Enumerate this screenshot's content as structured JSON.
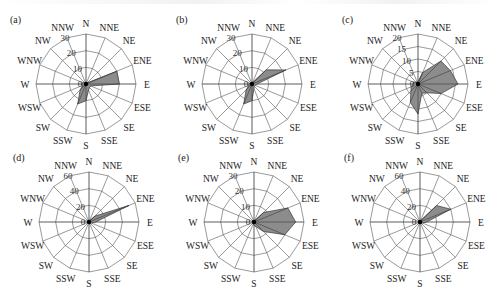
{
  "chart_data": [
    {
      "type": "rose",
      "panel": "(a)",
      "directions": [
        "N",
        "NNE",
        "NE",
        "ENE",
        "E",
        "ESE",
        "SE",
        "SSE",
        "S",
        "SSW",
        "SW",
        "WSW",
        "W",
        "WNW",
        "NW",
        "NNW"
      ],
      "values": [
        1,
        1,
        1,
        20,
        20,
        3,
        3,
        4,
        10,
        13,
        5,
        2,
        3,
        2,
        1,
        1
      ],
      "rmax": 30,
      "ticks": [
        0,
        10,
        20,
        30
      ],
      "tick_labels": [
        "0",
        "10",
        "20",
        "30"
      ]
    },
    {
      "type": "rose",
      "panel": "(b)",
      "directions": [
        "N",
        "NNE",
        "NE",
        "ENE",
        "E",
        "ESE",
        "SE",
        "SSE",
        "S",
        "SSW",
        "SW",
        "WSW",
        "W",
        "WNW",
        "NW",
        "NNW"
      ],
      "values": [
        1,
        1,
        12,
        22,
        3,
        2,
        2,
        3,
        10,
        13,
        5,
        2,
        2,
        1,
        1,
        1
      ],
      "rmax": 30,
      "ticks": [
        0,
        10,
        20,
        30
      ],
      "tick_labels": [
        "0",
        "10",
        "20",
        "30"
      ]
    },
    {
      "type": "rose",
      "panel": "(c)",
      "directions": [
        "N",
        "NNE",
        "NE",
        "ENE",
        "E",
        "ESE",
        "SE",
        "SSE",
        "S",
        "SSW",
        "SW",
        "WSW",
        "W",
        "WNW",
        "NW",
        "NNW"
      ],
      "values": [
        1,
        5,
        13,
        14,
        16,
        10,
        5,
        4,
        12,
        8,
        4,
        3,
        2,
        2,
        1,
        1
      ],
      "rmax": 20,
      "ticks": [
        0,
        5,
        10,
        15,
        20
      ],
      "tick_labels": [
        "0",
        "5",
        "10",
        "15",
        "20"
      ]
    },
    {
      "type": "rose",
      "panel": "(d)",
      "directions": [
        "N",
        "NNE",
        "NE",
        "ENE",
        "E",
        "ESE",
        "SE",
        "SSE",
        "S",
        "SSW",
        "SW",
        "WSW",
        "W",
        "WNW",
        "NW",
        "NNW"
      ],
      "values": [
        2,
        2,
        10,
        52,
        8,
        3,
        2,
        2,
        2,
        2,
        2,
        2,
        2,
        2,
        2,
        2
      ],
      "rmax": 60,
      "ticks": [
        0,
        20,
        40,
        60
      ],
      "tick_labels": [
        "0",
        "20",
        "40",
        "60"
      ]
    },
    {
      "type": "rose",
      "panel": "(e)",
      "directions": [
        "N",
        "NNE",
        "NE",
        "ENE",
        "E",
        "ESE",
        "SE",
        "SSE",
        "S",
        "SSW",
        "SW",
        "WSW",
        "W",
        "WNW",
        "NW",
        "NNW"
      ],
      "values": [
        1,
        1,
        8,
        22,
        25,
        20,
        8,
        3,
        2,
        1,
        1,
        1,
        1,
        1,
        1,
        1
      ],
      "rmax": 30,
      "ticks": [
        0,
        10,
        20,
        30
      ],
      "tick_labels": [
        "0",
        "10",
        "20",
        "30"
      ]
    },
    {
      "type": "rose",
      "panel": "(f)",
      "directions": [
        "N",
        "NNE",
        "NE",
        "ENE",
        "E",
        "ESE",
        "SE",
        "SSE",
        "S",
        "SSW",
        "SW",
        "WSW",
        "W",
        "WNW",
        "NW",
        "NNW"
      ],
      "values": [
        2,
        2,
        28,
        40,
        8,
        3,
        2,
        2,
        2,
        2,
        2,
        2,
        2,
        2,
        2,
        2
      ],
      "rmax": 60,
      "ticks": [
        0,
        20,
        40,
        60
      ],
      "tick_labels": [
        "0",
        "20",
        "40",
        "60"
      ]
    }
  ],
  "layout": {
    "grid": true,
    "legend": "none",
    "panels_per_row": 3,
    "fill_color": "#8c8c8c",
    "outline_color": "#3a3a3a",
    "grid_color": "#555555"
  }
}
